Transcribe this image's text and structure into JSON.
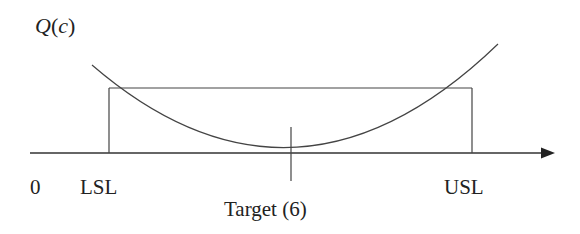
{
  "diagram": {
    "type": "quadratic-loss-function",
    "y_axis_label": "Q(c)",
    "y_axis_label_parts": {
      "func": "Q",
      "open": "(",
      "var": "c",
      "close": ")"
    },
    "origin_label": "0",
    "x_labels": {
      "lsl": "LSL",
      "usl": "USL",
      "target": "Target (6)"
    },
    "colors": {
      "line": "#333333",
      "text": "#222222",
      "background": "#ffffff"
    }
  }
}
